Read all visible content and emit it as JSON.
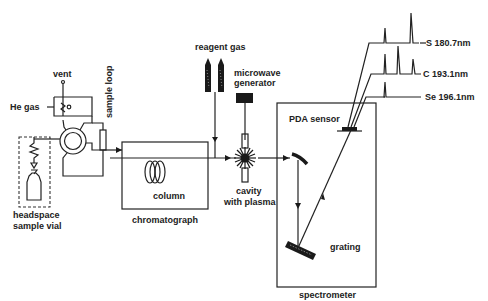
{
  "diagram": {
    "colors": {
      "ink": "#222222",
      "background": "#ffffff"
    },
    "labels": {
      "vent": "vent",
      "he_gas": "He gas",
      "sample_loop": "sample loop",
      "headspace_line1": "headspace",
      "headspace_line2": "sample vial",
      "column": "column",
      "chromatograph": "chromatograph",
      "reagent_gas": "reagent gas",
      "microwave_line1": "microwave",
      "microwave_line2": "generator",
      "cavity_line1": "cavity",
      "cavity_line2": "with plasma",
      "pda_sensor": "PDA sensor",
      "grating": "grating",
      "spectrometer": "spectrometer"
    },
    "channels": [
      {
        "element": "S",
        "wavelength": "180.7nm",
        "label": "S 180.7nm"
      },
      {
        "element": "C",
        "wavelength": "193.1nm",
        "label": "C 193.1nm"
      },
      {
        "element": "Se",
        "wavelength": "196.1nm",
        "label": "Se 196.1nm"
      }
    ],
    "components": [
      "headspace-sample-vial",
      "six-port-valve",
      "sample-loop",
      "he-gas-inlet",
      "vent",
      "chromatograph",
      "column",
      "reagent-gas-cylinders",
      "microwave-generator",
      "cavity-with-plasma",
      "spectrometer",
      "mirror",
      "grating",
      "pda-sensor"
    ]
  }
}
